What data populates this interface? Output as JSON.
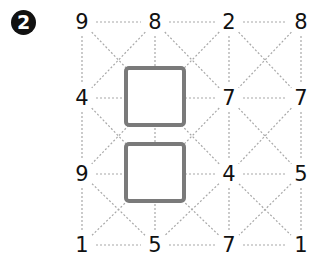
{
  "puzzle": {
    "number_badge": "2",
    "grid": {
      "columns_x": [
        82,
        155,
        229,
        301
      ],
      "rows_y": [
        22,
        98,
        174,
        245
      ],
      "values": [
        [
          "9",
          "8",
          "2",
          "8"
        ],
        [
          "4",
          "",
          "7",
          "7"
        ],
        [
          "9",
          "",
          "4",
          "5"
        ],
        [
          "1",
          "5",
          "7",
          "1"
        ]
      ],
      "blank_cells": [
        [
          1,
          1
        ],
        [
          2,
          1
        ]
      ]
    },
    "colors": {
      "text": "#111111",
      "dashed_line": "#a8a8a8",
      "answer_box_border": "#7a7a7a",
      "badge_bg": "#111111"
    }
  }
}
